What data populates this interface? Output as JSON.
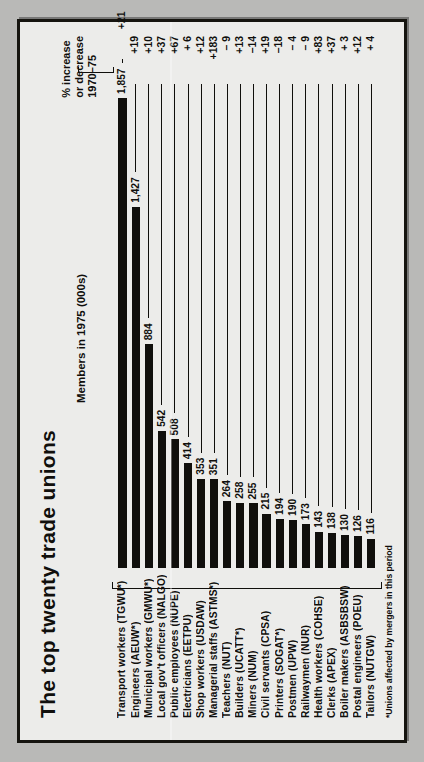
{
  "figure": {
    "title": "The top twenty trade unions",
    "members_caption": "Members in 1975 (000s)",
    "pct_caption_line1": "% increase",
    "pct_caption_line2": "or decrease",
    "pct_caption_line3": "1970–75",
    "footnote": "*Unions affected by mergers in this period"
  },
  "chart_data": {
    "type": "bar",
    "orientation": "horizontal",
    "title": "The top twenty trade unions",
    "xlabel": "Members in 1975 (000s)",
    "ylabel": "",
    "xlim": [
      0,
      1857
    ],
    "grid": false,
    "legend": false,
    "value_column_header": "Members in 1975 (000s)",
    "secondary_column_header": "% increase or decrease 1970–75",
    "footnote": "*Unions affected by mergers in this period",
    "categories": [
      "Transport workers (TGWU*)",
      "Engineers (AEUW*)",
      "Municipal workers (GMWU*)",
      "Local gov't officers (NALGO)",
      "Public employees (NUPE)",
      "Electricians (EETPU)",
      "Shop workers (USDAW)",
      "Managerial staffs (ASTMS*)",
      "Teachers (NUT)",
      "Builders (UCATT*)",
      "Miners (NUM)",
      "Civil servants (CPSA)",
      "Printers (SOGAT*)",
      "Postmen (UPW)",
      "Railwaymen (NUR)",
      "Health workers (COHSE)",
      "Clerks (APEX)",
      "Boiler makers (ASBSBSW)",
      "Postal engineers (POEU)",
      "Tailors (NUTGW)"
    ],
    "values": [
      1857,
      1427,
      884,
      542,
      508,
      414,
      353,
      351,
      264,
      258,
      255,
      215,
      194,
      190,
      173,
      143,
      138,
      130,
      126,
      116
    ],
    "value_labels": [
      "1,857",
      "1,427",
      "884",
      "542",
      "508",
      "414",
      "353",
      "351",
      "264",
      "258",
      "255",
      "215",
      "194",
      "190",
      "173",
      "143",
      "138",
      "130",
      "126",
      "116"
    ],
    "pct_change": [
      21,
      19,
      10,
      37,
      67,
      6,
      12,
      183,
      -9,
      13,
      -14,
      19,
      -18,
      -4,
      -9,
      83,
      37,
      3,
      12,
      4
    ],
    "pct_labels": [
      "+21",
      "+19",
      "+10",
      "+37",
      "+67",
      "+ 6",
      "+12",
      "+183",
      "– 9",
      "+13",
      "–14",
      "+19",
      "–18",
      "– 4",
      "– 9",
      "+83",
      "+37",
      "+ 3",
      "+12",
      "+ 4"
    ]
  },
  "rows": [
    {
      "label": "Transport workers (TGWU*)",
      "value_label": "1,857",
      "value": 1857,
      "pct_label": "+21"
    },
    {
      "label": "Engineers (AEUW*)",
      "value_label": "1,427",
      "value": 1427,
      "pct_label": "+19"
    },
    {
      "label": "Municipal workers (GMWU*)",
      "value_label": "884",
      "value": 884,
      "pct_label": "+10"
    },
    {
      "label": "Local gov't officers (NALGO)",
      "value_label": "542",
      "value": 542,
      "pct_label": "+37"
    },
    {
      "label": "Public employees (NUPE)",
      "value_label": "508",
      "value": 508,
      "pct_label": "+67"
    },
    {
      "label": "Electricians (EETPU)",
      "value_label": "414",
      "value": 414,
      "pct_label": "+ 6"
    },
    {
      "label": "Shop workers (USDAW)",
      "value_label": "353",
      "value": 353,
      "pct_label": "+12"
    },
    {
      "label": "Managerial staffs (ASTMS*)",
      "value_label": "351",
      "value": 351,
      "pct_label": "+183"
    },
    {
      "label": "Teachers (NUT)",
      "value_label": "264",
      "value": 264,
      "pct_label": "– 9"
    },
    {
      "label": "Builders (UCATT*)",
      "value_label": "258",
      "value": 258,
      "pct_label": "+13"
    },
    {
      "label": "Miners (NUM)",
      "value_label": "255",
      "value": 255,
      "pct_label": "–14"
    },
    {
      "label": "Civil servants (CPSA)",
      "value_label": "215",
      "value": 215,
      "pct_label": "+19"
    },
    {
      "label": "Printers (SOGAT*)",
      "value_label": "194",
      "value": 194,
      "pct_label": "–18"
    },
    {
      "label": "Postmen (UPW)",
      "value_label": "190",
      "value": 190,
      "pct_label": "– 4"
    },
    {
      "label": "Railwaymen (NUR)",
      "value_label": "173",
      "value": 173,
      "pct_label": "– 9"
    },
    {
      "label": "Health workers (COHSE)",
      "value_label": "143",
      "value": 143,
      "pct_label": "+83"
    },
    {
      "label": "Clerks (APEX)",
      "value_label": "138",
      "value": 138,
      "pct_label": "+37"
    },
    {
      "label": "Boiler makers (ASBSBSW)",
      "value_label": "130",
      "value": 130,
      "pct_label": "+ 3"
    },
    {
      "label": "Postal engineers (POEU)",
      "value_label": "126",
      "value": 126,
      "pct_label": "+12"
    },
    {
      "label": "Tailors (NUTGW)",
      "value_label": "116",
      "value": 116,
      "pct_label": "+ 4"
    }
  ]
}
